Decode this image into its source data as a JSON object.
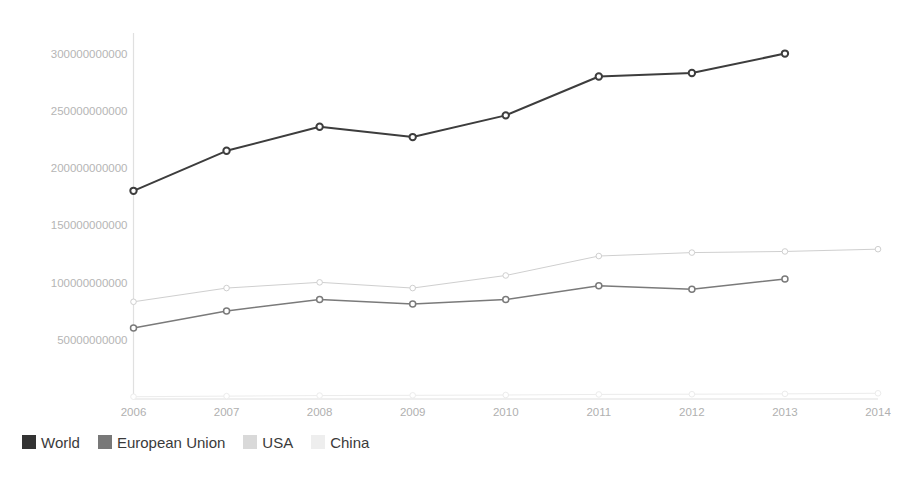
{
  "chart_data": {
    "type": "line",
    "title": "",
    "subtitle": "",
    "xlabel": "",
    "ylabel": "",
    "x": [
      2006,
      2007,
      2008,
      2009,
      2010,
      2011,
      2012,
      2013,
      2014
    ],
    "xticklabels": [
      "2006",
      "2007",
      "2008",
      "2009",
      "2010",
      "2011",
      "2012",
      "2013",
      "2014"
    ],
    "yticks": [
      50000000000,
      100000000000,
      150000000000,
      200000000000,
      250000000000,
      300000000000
    ],
    "yticklabels": [
      "50000000000",
      "100000000000",
      "150000000000",
      "200000000000",
      "250000000000",
      "300000000000"
    ],
    "ylim": [
      0,
      320000000000
    ],
    "xlim": [
      2006,
      2014
    ],
    "grid": false,
    "legend_position": "bottom-left",
    "series": [
      {
        "name": "World",
        "color": "#3d3d3d",
        "marker": "circle-open",
        "values": [
          182000000000,
          217000000000,
          238000000000,
          229000000000,
          248000000000,
          282000000000,
          285000000000,
          302000000000,
          null
        ]
      },
      {
        "name": "European Union",
        "color": "#7a7a7a",
        "marker": "circle-open",
        "values": [
          62000000000,
          77000000000,
          87000000000,
          83000000000,
          87000000000,
          99000000000,
          96000000000,
          105000000000,
          null
        ]
      },
      {
        "name": "USA",
        "color": "#cfcfcf",
        "marker": "circle-open",
        "values": [
          85000000000,
          97000000000,
          102000000000,
          97000000000,
          108000000000,
          125000000000,
          128000000000,
          129000000000,
          131000000000
        ]
      },
      {
        "name": "China",
        "color": "#ececec",
        "marker": "circle-open",
        "values": [
          2000000000,
          2500000000,
          3000000000,
          3200000000,
          3500000000,
          4000000000,
          4200000000,
          4500000000,
          5000000000
        ]
      }
    ]
  },
  "legend": {
    "items": [
      {
        "label": "World",
        "color": "#333333"
      },
      {
        "label": "European Union",
        "color": "#787878"
      },
      {
        "label": "USA",
        "color": "#d9d9d9"
      },
      {
        "label": "China",
        "color": "#eeeeee"
      }
    ]
  },
  "axes": {
    "axis_color": "#e0e0e0",
    "tick_label_color": "#b5b5b5"
  }
}
